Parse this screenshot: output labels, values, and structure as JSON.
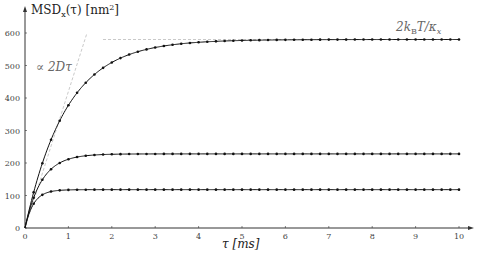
{
  "chart_data": {
    "type": "line",
    "title": "",
    "xlabel": "τ [ms]",
    "ylabel": "MSD_x(τ) [nm²]",
    "xlim": [
      0,
      10
    ],
    "ylim": [
      0,
      620
    ],
    "xticks": [
      0,
      1,
      2,
      3,
      4,
      5,
      6,
      7,
      8,
      9,
      10
    ],
    "yticks": [
      0,
      100,
      200,
      300,
      400,
      500,
      600
    ],
    "grid": false,
    "series": [
      {
        "name": "curve-high",
        "plateau": 580,
        "tau_c": 0.95
      },
      {
        "name": "curve-mid",
        "plateau": 228,
        "tau_c": 0.38
      },
      {
        "name": "curve-low",
        "plateau": 118,
        "tau_c": 0.2
      }
    ],
    "marker_spacing": 0.2,
    "annotations": [
      {
        "text": "∝ 2Dτ",
        "kind": "dashed-asymptote-line",
        "slope": 420
      },
      {
        "text": "2k_B T/κ_x",
        "kind": "dashed-plateau-line",
        "y": 580
      }
    ]
  },
  "labels": {
    "ylabel_main": "MSD",
    "ylabel_sub": "x",
    "ylabel_rest": "(τ) [nm",
    "ylabel_sup": "2",
    "ylabel_end": "]",
    "xlabel": "τ  [ms]",
    "ann_slope": "∝ 2Dτ",
    "ann_plateau_pre": "2k",
    "ann_plateau_sub": "B",
    "ann_plateau_post": "T/κ",
    "ann_plateau_sub2": "x"
  }
}
